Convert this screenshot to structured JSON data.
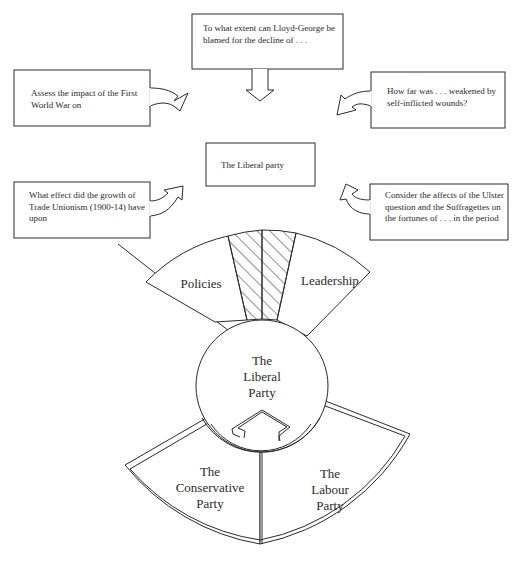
{
  "diagram": {
    "central_box": {
      "text": "The Liberal party"
    },
    "question_boxes": [
      {
        "id": "top",
        "text": "To what extent can Lloyd-George be blamed for the decline of . . .",
        "arrow": "down"
      },
      {
        "id": "upper-left",
        "text": "Assess the impact of the First World War on",
        "arrow": "curved-right"
      },
      {
        "id": "upper-right",
        "text": "How far was . . . weakened by self-inflicted wounds?",
        "arrow": "curved-left"
      },
      {
        "id": "lower-left",
        "text": "What effect did the growth of Trade Unionism (1900-14) have upon",
        "arrow": "curved-right-up"
      },
      {
        "id": "lower-right",
        "text": "Consider the affects of the Ulster question and the Suffragettes on the fortunes of . . . in the period",
        "arrow": "curved-left-up"
      }
    ],
    "wheel": {
      "center": {
        "line1": "The",
        "line2": "Liberal",
        "line3": "Party"
      },
      "upper_segments": [
        {
          "label": "Policies"
        },
        {
          "label": "Leadership"
        }
      ],
      "hatched_segment": {
        "label": ""
      },
      "lower_segments": [
        {
          "line1": "The",
          "line2": "Conservative",
          "line3": "Party"
        },
        {
          "line1": "The",
          "line2": "Labour",
          "line3": "Party"
        }
      ]
    },
    "colors": {
      "stroke": "#2a2a2a",
      "background": "#ffffff"
    }
  }
}
